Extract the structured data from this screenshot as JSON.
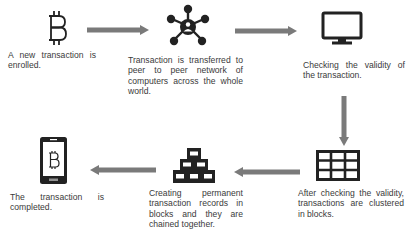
{
  "diagram": {
    "type": "flow",
    "title": "",
    "colors": {
      "arrow": "#7a7a7a",
      "icon": "#222222",
      "text": "#3a3a3a",
      "background": "#ffffff"
    },
    "steps": [
      {
        "id": 1,
        "icon": "bitcoin-icon",
        "label": "A new transaction is enrolled."
      },
      {
        "id": 2,
        "icon": "network-hub-icon",
        "label": "Transaction is transferred to peer to peer network of computers across the whole world."
      },
      {
        "id": 3,
        "icon": "monitor-icon",
        "label": "Checking the validity of the transaction."
      },
      {
        "id": 4,
        "icon": "grid-blocks-icon",
        "label": "After checking the validity, transactions are clustered in blocks."
      },
      {
        "id": 5,
        "icon": "stacked-blocks-icon",
        "label": "Creating permanent transaction records in blocks and they are chained together."
      },
      {
        "id": 6,
        "icon": "mobile-bitcoin-icon",
        "label": "The transaction is completed."
      }
    ],
    "arrows": [
      {
        "from": 1,
        "to": 2,
        "direction": "right"
      },
      {
        "from": 2,
        "to": 3,
        "direction": "right"
      },
      {
        "from": 3,
        "to": 4,
        "direction": "down"
      },
      {
        "from": 4,
        "to": 5,
        "direction": "left"
      },
      {
        "from": 5,
        "to": 6,
        "direction": "left"
      }
    ]
  }
}
